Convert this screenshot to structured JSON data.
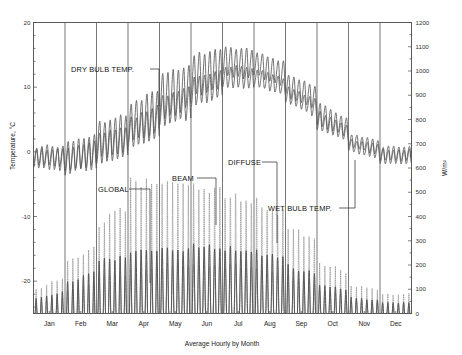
{
  "chart_data": {
    "type": "line",
    "title": "",
    "xlabel": "Average Hourly by Month",
    "ylabel": "Temperature, °C",
    "y2label": "W/m²",
    "ylim": [
      -25,
      20
    ],
    "y2lim": [
      0,
      1200
    ],
    "xlim": [
      0,
      12
    ],
    "grid": "vertical-month-separators",
    "legend": "inline-annotations",
    "categories": [
      "Jan",
      "Feb",
      "Mar",
      "Apr",
      "May",
      "Jun",
      "Jul",
      "Aug",
      "Sep",
      "Oct",
      "Nov",
      "Dec"
    ],
    "yticks": [
      20,
      10,
      0,
      -10,
      -20
    ],
    "y2ticks": [
      0,
      100,
      200,
      300,
      400,
      500,
      600,
      700,
      800,
      900,
      1000,
      1100,
      1200
    ],
    "annotations": [
      {
        "text": "DRY BULB TEMP.",
        "series": "dry_bulb"
      },
      {
        "text": "GLOBAL",
        "series": "global"
      },
      {
        "text": "BEAM",
        "series": "beam"
      },
      {
        "text": "DIFFUSE",
        "series": "diffuse"
      },
      {
        "text": "WET BULB TEMP.",
        "series": "wet_bulb"
      }
    ],
    "series": [
      {
        "name": "DRY BULB TEMP.",
        "axis": "left",
        "unit": "°C",
        "style": "solid",
        "monthly_min": [
          -2.0,
          -3.2,
          -1.5,
          1.0,
          4.5,
          8.0,
          11.0,
          11.5,
          8.5,
          4.0,
          0.5,
          -1.5
        ],
        "monthly_max": [
          1.0,
          1.5,
          4.5,
          8.0,
          12.0,
          15.5,
          16.8,
          16.0,
          12.5,
          8.0,
          3.0,
          1.0
        ]
      },
      {
        "name": "WET BULB TEMP.",
        "axis": "left",
        "unit": "°C",
        "style": "solid",
        "monthly_min": [
          -2.5,
          -3.6,
          -2.0,
          0.2,
          3.2,
          6.5,
          9.5,
          10.0,
          7.5,
          3.2,
          0.0,
          -2.0
        ],
        "monthly_max": [
          0.5,
          0.8,
          3.0,
          5.5,
          9.0,
          12.0,
          13.5,
          13.0,
          10.5,
          6.5,
          2.2,
          0.5
        ]
      },
      {
        "name": "GLOBAL",
        "axis": "right",
        "unit": "W/m²",
        "style": "solid",
        "monthly_peak": [
          60,
          130,
          215,
          250,
          265,
          275,
          270,
          255,
          195,
          120,
          65,
          45
        ]
      },
      {
        "name": "BEAM",
        "axis": "right",
        "unit": "W/m²",
        "style": "dotted",
        "monthly_peak": [
          95,
          200,
          330,
          450,
          440,
          470,
          455,
          440,
          330,
          180,
          95,
          70
        ]
      },
      {
        "name": "DIFFUSE",
        "axis": "right",
        "unit": "W/m²",
        "style": "thin",
        "monthly_peak": [
          50,
          95,
          150,
          175,
          200,
          205,
          200,
          185,
          145,
          95,
          55,
          38
        ]
      }
    ]
  },
  "axes": {
    "left_title": "Temperature, °C",
    "right_title": "W/m²",
    "bottom_title": "Average Hourly by Month",
    "left_ticks": [
      "20",
      "10",
      "0",
      "-10",
      "-20"
    ],
    "right_ticks": [
      "1200",
      "1100",
      "1000",
      "900",
      "800",
      "700",
      "600",
      "500",
      "400",
      "300",
      "200",
      "100",
      "0"
    ],
    "months": [
      "Jan",
      "Feb",
      "Mar",
      "Apr",
      "May",
      "Jun",
      "Jul",
      "Aug",
      "Sep",
      "Oct",
      "Nov",
      "Dec"
    ]
  },
  "labels": {
    "dry_bulb": "DRY BULB TEMP.",
    "wet_bulb": "WET BULB TEMP.",
    "global": "GLOBAL",
    "beam": "BEAM",
    "diffuse": "DIFFUSE"
  },
  "colors": {
    "axis": "#4a4a4a",
    "text": "#1a1a1a",
    "series": "#555555"
  }
}
